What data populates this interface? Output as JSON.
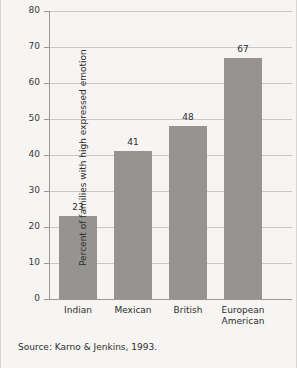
{
  "chart_data": {
    "type": "bar",
    "title": "",
    "xlabel": "",
    "ylabel": "Percent of families with high expressed emotion",
    "categories": [
      "Indian",
      "Mexican",
      "British",
      "European American"
    ],
    "category_lines": [
      [
        "Indian"
      ],
      [
        "Mexican"
      ],
      [
        "British"
      ],
      [
        "European",
        "American"
      ]
    ],
    "values": [
      23,
      41,
      48,
      67
    ],
    "value_labels": [
      "23",
      "41",
      "48",
      "67"
    ],
    "ylim": [
      0,
      80
    ],
    "yticks": [
      0,
      10,
      20,
      30,
      40,
      50,
      60,
      70,
      80
    ],
    "ytick_labels": [
      "0",
      "10",
      "20",
      "30",
      "40",
      "50",
      "60",
      "70",
      "80"
    ],
    "grid": true,
    "legend": false,
    "bar_color": "#969490",
    "grid_color": "#c9c7c3",
    "axis_color": "#9a9894",
    "background_color": "#f6f5f3"
  },
  "footer": {
    "source": "Source: Karno & Jenkins, 1993."
  }
}
